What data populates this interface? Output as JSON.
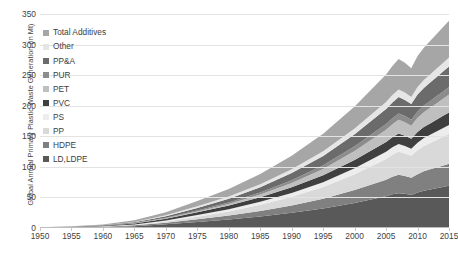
{
  "chart_data": {
    "type": "area",
    "title": "",
    "xlabel": "",
    "ylabel": "Global Annual Primary Plastic Waste Generation (in Mt)",
    "stacked": true,
    "grid": true,
    "legend_position": "inside-top-left",
    "xlim": [
      1950,
      2015
    ],
    "ylim": [
      0,
      350
    ],
    "ytick_labels": [
      "350",
      "300",
      "250",
      "200",
      "150",
      "100",
      "50",
      "0"
    ],
    "ytick_values": [
      350,
      300,
      250,
      200,
      150,
      100,
      50,
      0
    ],
    "xtick_labels": [
      "1950",
      "1955",
      "1960",
      "1965",
      "1970",
      "1975",
      "1980",
      "1985",
      "1990",
      "1995",
      "2000",
      "2005",
      "2010",
      "2015"
    ],
    "xtick_values": [
      1950,
      1955,
      1960,
      1965,
      1970,
      1975,
      1980,
      1985,
      1990,
      1995,
      2000,
      2005,
      2010,
      2015
    ],
    "x": [
      1950,
      1955,
      1960,
      1965,
      1970,
      1975,
      1980,
      1985,
      1990,
      1995,
      2000,
      2005,
      2006,
      2007,
      2008,
      2009,
      2010,
      2011,
      2012,
      2013,
      2014,
      2015
    ],
    "series": [
      {
        "name": "LD,LDPE",
        "color": "#595959",
        "values": [
          0.3,
          0.7,
          1.4,
          3.0,
          6.0,
          10.0,
          14.0,
          19.0,
          25.0,
          32.0,
          41.0,
          52.0,
          55.0,
          57.0,
          56.0,
          54.0,
          58.0,
          61.0,
          63.0,
          65.0,
          67.0,
          69.0
        ]
      },
      {
        "name": "HDPE",
        "color": "#808080",
        "values": [
          0.1,
          0.3,
          0.6,
          1.3,
          2.6,
          4.5,
          6.5,
          9.0,
          12.0,
          16.0,
          21.0,
          27.0,
          29.0,
          30.0,
          29.0,
          28.0,
          30.0,
          32.0,
          33.0,
          34.0,
          35.0,
          36.0
        ]
      },
      {
        "name": "PP",
        "color": "#d9d9d9",
        "values": [
          0.0,
          0.1,
          0.3,
          0.8,
          2.0,
          4.0,
          6.5,
          10.0,
          14.0,
          19.0,
          26.0,
          34.0,
          36.0,
          38.0,
          37.0,
          36.0,
          39.0,
          41.0,
          43.0,
          45.0,
          47.0,
          49.0
        ]
      },
      {
        "name": "PS",
        "color": "#ededed",
        "values": [
          0.1,
          0.2,
          0.4,
          0.8,
          1.6,
          2.6,
          3.6,
          4.8,
          6.2,
          7.8,
          9.6,
          11.6,
          12.0,
          12.4,
          12.2,
          11.8,
          12.6,
          13.0,
          13.4,
          13.8,
          14.2,
          14.6
        ]
      },
      {
        "name": "PVC",
        "color": "#3f3f3f",
        "values": [
          0.2,
          0.4,
          0.8,
          1.6,
          3.0,
          4.6,
          6.0,
          7.6,
          9.4,
          11.4,
          13.6,
          16.0,
          16.6,
          17.2,
          16.8,
          16.2,
          17.4,
          18.0,
          18.6,
          19.2,
          19.8,
          20.4
        ]
      },
      {
        "name": "PET",
        "color": "#bfbfbf",
        "values": [
          0.0,
          0.0,
          0.1,
          0.2,
          0.6,
          1.4,
          2.6,
          4.4,
          7.0,
          10.4,
          14.8,
          20.0,
          21.2,
          22.4,
          22.0,
          21.4,
          23.2,
          24.4,
          25.6,
          26.8,
          28.0,
          29.2
        ]
      },
      {
        "name": "PUR",
        "color": "#8c8c8c",
        "values": [
          0.0,
          0.1,
          0.2,
          0.4,
          0.9,
          1.6,
          2.4,
          3.4,
          4.6,
          6.0,
          7.6,
          9.4,
          9.8,
          10.2,
          10.0,
          9.6,
          10.4,
          10.8,
          11.2,
          11.6,
          12.0,
          12.4
        ]
      },
      {
        "name": "PP&A",
        "color": "#6b6b6b",
        "values": [
          0.1,
          0.2,
          0.5,
          1.1,
          2.4,
          4.2,
          6.2,
          8.6,
          11.6,
          15.2,
          19.6,
          24.6,
          25.8,
          27.0,
          26.4,
          25.6,
          27.6,
          28.8,
          30.0,
          31.2,
          32.4,
          33.6
        ]
      },
      {
        "name": "Other",
        "color": "#e6e6e6",
        "values": [
          0.1,
          0.2,
          0.4,
          0.8,
          1.6,
          2.6,
          3.6,
          4.8,
          6.2,
          7.8,
          9.6,
          11.6,
          12.0,
          12.4,
          12.2,
          11.8,
          12.6,
          13.0,
          13.4,
          13.8,
          14.2,
          14.6
        ]
      },
      {
        "name": "Total Additives",
        "color": "#a6a6a6",
        "values": [
          0.3,
          0.6,
          1.2,
          2.6,
          5.2,
          8.8,
          12.4,
          16.8,
          22.0,
          28.4,
          36.0,
          45.0,
          47.4,
          49.6,
          48.6,
          47.0,
          50.4,
          52.8,
          54.6,
          56.4,
          58.2,
          60.0
        ]
      }
    ],
    "legend_order": [
      "Total Additives",
      "Other",
      "PP&A",
      "PUR",
      "PET",
      "PVC",
      "PS",
      "PP",
      "HDPE",
      "LD,LDPE"
    ]
  }
}
